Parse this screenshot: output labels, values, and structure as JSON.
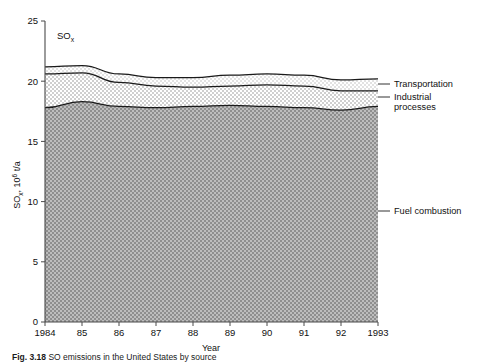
{
  "figure": {
    "inline_annotation": "SO",
    "inline_annotation_sub": "x",
    "caption_prefix": "Fig. 3.18",
    "caption_text": "SO  emissions in the United States by source",
    "caption_clipped": true
  },
  "axes": {
    "ylabel_main": "SO",
    "ylabel_sub": "x",
    "ylabel_rest": ", 10",
    "ylabel_exp": "6",
    "ylabel_tail": " t/a",
    "xlabel": "Year",
    "yticks": [
      "0",
      "5",
      "10",
      "15",
      "20",
      "25"
    ],
    "xticks": [
      "1984",
      "85",
      "86",
      "87",
      "88",
      "89",
      "90",
      "91",
      "92",
      "1993"
    ]
  },
  "legend": {
    "items": [
      {
        "label": "Transportation",
        "label2": ""
      },
      {
        "label": "Industrial",
        "label2": "processes"
      },
      {
        "label": "Fuel combustion",
        "label2": ""
      }
    ]
  },
  "colors": {
    "fuel_fill": "#a8a8a8",
    "industrial_fill": "#dcdcdc",
    "transportation_fill": "#efefef",
    "line": "#1a1a1a",
    "axis": "#4a4a4a",
    "background": "#ffffff"
  },
  "chart_data": {
    "type": "area",
    "title": "",
    "subtitle": "",
    "xlabel": "Year",
    "ylabel": "SOx, 10^6 t/a",
    "x": [
      1984,
      1985,
      1986,
      1987,
      1988,
      1989,
      1990,
      1991,
      1992,
      1993
    ],
    "xtick_labels": [
      "1984",
      "85",
      "86",
      "87",
      "88",
      "89",
      "90",
      "91",
      "92",
      "1993"
    ],
    "xlim": [
      1984,
      1993
    ],
    "ylim": [
      0,
      25
    ],
    "yticks": [
      0,
      5,
      10,
      15,
      20,
      25
    ],
    "grid": false,
    "stacked": true,
    "legend_position": "right-outside",
    "annotations": [
      "SOx"
    ],
    "series": [
      {
        "name": "Fuel combustion",
        "values": [
          17.8,
          18.3,
          17.9,
          17.8,
          17.9,
          18.0,
          17.9,
          17.8,
          17.6,
          17.9
        ]
      },
      {
        "name": "Industrial processes",
        "values": [
          2.8,
          2.4,
          2.0,
          1.8,
          1.6,
          1.6,
          1.8,
          1.8,
          1.6,
          1.3
        ]
      },
      {
        "name": "Transportation",
        "values": [
          0.6,
          0.6,
          0.7,
          0.7,
          0.8,
          0.9,
          0.9,
          0.9,
          0.9,
          1.0
        ]
      }
    ],
    "cumulative_totals": [
      21.2,
      21.3,
      20.6,
      20.3,
      20.3,
      20.5,
      20.6,
      20.5,
      20.1,
      20.2
    ]
  }
}
